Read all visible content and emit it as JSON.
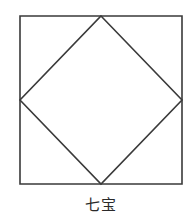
{
  "diagram": {
    "caption": "七宝",
    "stroke_color": "#3a3a3a",
    "background": "#ffffff",
    "shapes": [
      {
        "type": "square",
        "name": "outer-square",
        "points": [
          [
            20,
            16
          ],
          [
            182,
            16
          ],
          [
            182,
            184
          ],
          [
            20,
            184
          ]
        ]
      },
      {
        "type": "diamond",
        "name": "inscribed-diamond",
        "points": [
          [
            101,
            16
          ],
          [
            182,
            100
          ],
          [
            101,
            184
          ],
          [
            20,
            100
          ]
        ]
      }
    ]
  }
}
